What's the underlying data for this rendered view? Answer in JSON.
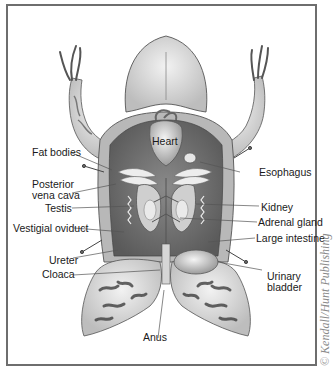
{
  "figure": {
    "labels": {
      "heart": "Heart",
      "fat_bodies": "Fat bodies",
      "posterior_vena_cava_line1": "Posterior",
      "posterior_vena_cava_line2": "vena cava",
      "testis": "Testis",
      "vestigial_oviduct": "Vestigial oviduct",
      "ureter": "Ureter",
      "cloaca": "Cloaca",
      "anus": "Anus",
      "esophagus": "Esophagus",
      "kidney": "Kidney",
      "adrenal_gland": "Adrenal gland",
      "large_intestine": "Large intestine",
      "urinary_bladder_line1": "Urinary",
      "urinary_bladder_line2": "bladder"
    },
    "copyright": "© Kendall/Hunt Publishing",
    "colors": {
      "border": "#6e6e6e",
      "label_text": "#1a1a1a",
      "leader_line": "#555555",
      "copyright_text": "#8a8a8a"
    }
  }
}
